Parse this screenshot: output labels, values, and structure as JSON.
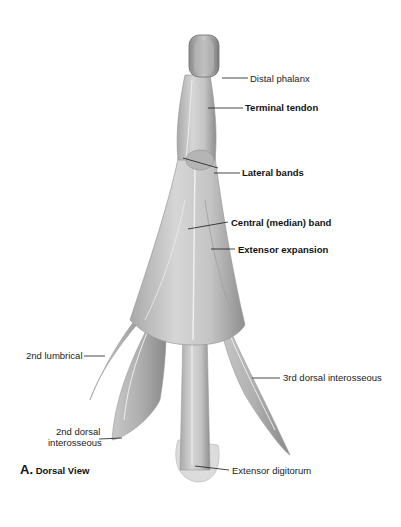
{
  "figure": {
    "title": "Dorsal View",
    "letter": "A.",
    "colors": {
      "background": "#ffffff",
      "tissue_light": "#d9d9d9",
      "tissue_mid": "#bcbcbc",
      "tissue_dark": "#8e8e8e",
      "leader_line": "#1a1a1a",
      "label_text": "#222222"
    }
  },
  "labels": [
    {
      "id": "distal-phalanx",
      "text": "Distal phalanx",
      "bold": false
    },
    {
      "id": "terminal-tendon",
      "text": "Terminal tendon",
      "bold": true
    },
    {
      "id": "lateral-bands",
      "text": "Lateral bands",
      "bold": true
    },
    {
      "id": "central-band",
      "text": "Central (median) band",
      "bold": true
    },
    {
      "id": "extensor-expansion",
      "text": "Extensor expansion",
      "bold": true
    },
    {
      "id": "2nd-lumbrical",
      "text": "2nd lumbrical",
      "bold": false
    },
    {
      "id": "3rd-dorsal-interosseous",
      "text": "3rd dorsal interosseous",
      "bold": false
    },
    {
      "id": "2nd-dorsal-interosseous-line1",
      "text": "2nd dorsal",
      "bold": false
    },
    {
      "id": "2nd-dorsal-interosseous-line2",
      "text": "interosseous",
      "bold": false
    },
    {
      "id": "extensor-digitorum",
      "text": "Extensor digitorum",
      "bold": false
    }
  ]
}
